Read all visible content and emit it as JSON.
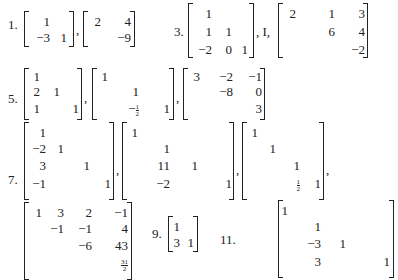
{
  "problems": [
    {
      "label": "1.",
      "matrices": [
        {
          "rows": [
            [
              "1",
              ""
            ],
            [
              "−3",
              "1"
            ]
          ]
        },
        {
          "rows": [
            [
              "2",
              "4"
            ],
            [
              "",
              "−9"
            ]
          ]
        }
      ]
    },
    {
      "label": "3.",
      "matrices": [
        {
          "rows": [
            [
              "1",
              "",
              ""
            ],
            [
              "1",
              "1",
              ""
            ],
            [
              "−2",
              "0",
              "1"
            ]
          ]
        },
        {
          "symbol": "I"
        },
        {
          "rows": [
            [
              "2",
              "1",
              "3"
            ],
            [
              "",
              "6",
              "4"
            ],
            [
              "",
              "",
              "−2"
            ]
          ]
        }
      ]
    },
    {
      "label": "5.",
      "matrices": [
        {
          "rows": [
            [
              "1",
              "",
              ""
            ],
            [
              "2",
              "1",
              ""
            ],
            [
              "1",
              "",
              "1"
            ]
          ]
        },
        {
          "rows": [
            [
              "1",
              "",
              ""
            ],
            [
              "",
              "1",
              ""
            ],
            [
              "",
              "−1/2",
              "1"
            ]
          ]
        },
        {
          "rows": [
            [
              "3",
              "−2",
              "−1"
            ],
            [
              "",
              "−8",
              "0"
            ],
            [
              "",
              "",
              "3"
            ]
          ]
        }
      ]
    },
    {
      "label": "7.",
      "matrices": [
        {
          "rows": [
            [
              "1",
              "",
              "",
              ""
            ],
            [
              "−2",
              "1",
              "",
              ""
            ],
            [
              "3",
              "",
              "1",
              ""
            ],
            [
              "−1",
              "",
              "",
              "1"
            ]
          ]
        },
        {
          "rows": [
            [
              "1",
              "",
              "",
              ""
            ],
            [
              "",
              "1",
              "",
              ""
            ],
            [
              "",
              "11",
              "1",
              ""
            ],
            [
              "",
              "−2",
              "",
              "1"
            ]
          ]
        },
        {
          "rows": [
            [
              "1",
              "",
              "",
              ""
            ],
            [
              "",
              "1",
              "",
              ""
            ],
            [
              "",
              "",
              "1",
              ""
            ],
            [
              "",
              "",
              "1/2",
              "1"
            ]
          ]
        },
        {
          "rows": [
            [
              "1",
              "3",
              "2",
              "−1"
            ],
            [
              "",
              "−1",
              "−1",
              "4"
            ],
            [
              "",
              "",
              "−6",
              "43"
            ],
            [
              "",
              "",
              "",
              "31/2"
            ]
          ]
        }
      ]
    },
    {
      "label": "9.",
      "matrices": [
        {
          "rows": [
            [
              "1",
              ""
            ],
            [
              "3",
              "1"
            ]
          ]
        }
      ]
    },
    {
      "label": "11.",
      "matrices": [
        {
          "rows": [
            [
              "1",
              "",
              "",
              ""
            ],
            [
              "",
              "1",
              "",
              ""
            ],
            [
              "",
              "−3",
              "1",
              ""
            ],
            [
              "",
              "3",
              "",
              "1"
            ]
          ]
        }
      ]
    }
  ],
  "text": {
    "p1": "1.",
    "p3": "3.",
    "p5": "5.",
    "p7": "7.",
    "p9": "9.",
    "p11": "11.",
    "comma": ",",
    "I_sep": ", I,",
    "footer_partial": "13. ..."
  }
}
